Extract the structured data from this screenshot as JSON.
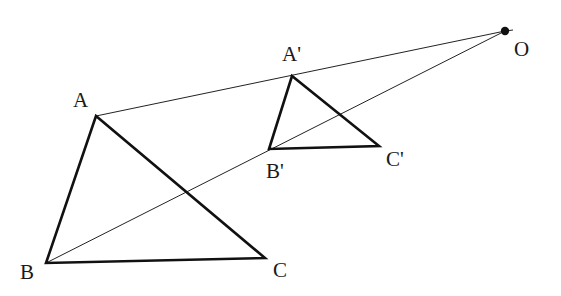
{
  "diagram": {
    "title": "",
    "center": {
      "label": "O",
      "x": 505,
      "y": 31,
      "label_x": 514,
      "label_y": 56
    },
    "triangle_original": {
      "vertices": [
        {
          "label": "A",
          "x": 96,
          "y": 116,
          "label_x": 73,
          "label_y": 107
        },
        {
          "label": "B",
          "x": 46,
          "y": 263,
          "label_x": 20,
          "label_y": 279
        },
        {
          "label": "C",
          "x": 265,
          "y": 258,
          "label_x": 273,
          "label_y": 277
        }
      ]
    },
    "triangle_image": {
      "vertices": [
        {
          "label": "A'",
          "x": 292,
          "y": 76,
          "label_x": 282,
          "label_y": 61
        },
        {
          "label": "B'",
          "x": 269,
          "y": 149,
          "label_x": 266,
          "label_y": 178
        },
        {
          "label": "C'",
          "x": 379,
          "y": 146,
          "label_x": 386,
          "label_y": 166
        }
      ]
    },
    "rays": [
      {
        "from": "A",
        "to": "O"
      },
      {
        "from": "B",
        "to": "O"
      }
    ],
    "colors": {
      "stroke": "#111111",
      "background": "#ffffff"
    }
  }
}
